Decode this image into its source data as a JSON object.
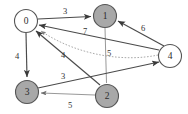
{
  "figure": {
    "type": "directed-weighted-graph",
    "background_color": "#ffffff",
    "width": 188,
    "height": 114
  },
  "graph_data": {
    "type": "diagram",
    "directed": true,
    "weighted": true,
    "node_fill_filled": "#a8a8a8",
    "node_fill_open": "#ffffff",
    "node_stroke": "#555555",
    "edge_color": "#4a4a4a",
    "nodes": [
      {
        "id": "n0",
        "label": "0",
        "x": 26,
        "y": 21,
        "r": 11.5,
        "style": "open"
      },
      {
        "id": "n1",
        "label": "1",
        "x": 105,
        "y": 16,
        "r": 11.5,
        "style": "filled"
      },
      {
        "id": "n2",
        "label": "2",
        "x": 107,
        "y": 96,
        "r": 11.5,
        "style": "filled"
      },
      {
        "id": "n3",
        "label": "3",
        "x": 27,
        "y": 92,
        "r": 11.5,
        "style": "filled"
      },
      {
        "id": "n4",
        "label": "4",
        "x": 170,
        "y": 56,
        "r": 11.5,
        "style": "open"
      }
    ],
    "edges": [
      {
        "id": "e0_1",
        "from": "0",
        "to": "1",
        "weight": "3",
        "label_x": 65,
        "label_y": 11,
        "style": "solid"
      },
      {
        "id": "e0_3",
        "from": "0",
        "to": "3",
        "weight": "4",
        "label_x": 17,
        "label_y": 56,
        "style": "solid"
      },
      {
        "id": "e4_1",
        "from": "4",
        "to": "1",
        "weight": "6",
        "label_x": 143,
        "label_y": 28,
        "style": "solid"
      },
      {
        "id": "e4_0",
        "from": "4",
        "to": "0",
        "weight": "7",
        "label_x": 85,
        "label_y": 31,
        "style": "solid"
      },
      {
        "id": "e4_0_alt",
        "from": "4",
        "to": "0",
        "weight": "5",
        "label_x": 109,
        "label_y": 53,
        "style": "dotted"
      },
      {
        "id": "e2_0",
        "from": "2",
        "to": "0",
        "weight": "4",
        "label_x": 63,
        "label_y": 55,
        "style": "solid"
      },
      {
        "id": "e2_3",
        "from": "2",
        "to": "3",
        "weight": "5",
        "label_x": 70,
        "label_y": 105,
        "style": "solid"
      },
      {
        "id": "e3_4",
        "from": "3",
        "to": "4",
        "weight": "3",
        "label_x": 63,
        "label_y": 76,
        "style": "solid"
      },
      {
        "id": "e1_2",
        "from": "1",
        "to": "2",
        "weight": "",
        "label_x": 0,
        "label_y": 0,
        "style": "thin"
      }
    ]
  }
}
